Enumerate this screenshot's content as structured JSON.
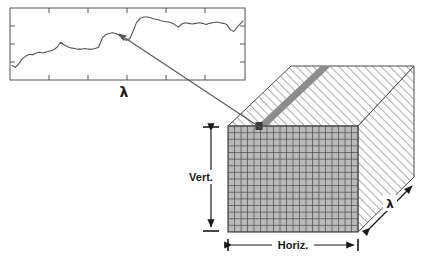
{
  "figure": {
    "background_color": "#ffffff",
    "width": 435,
    "height": 263
  },
  "spectrum_plot": {
    "frame_color": "#555555",
    "curve_color": "#555555",
    "axis_label": "λ",
    "tick_count_x": 5,
    "tick_count_y": 3,
    "box": {
      "x": 10,
      "y": 8,
      "width": 235,
      "height": 72
    }
  },
  "chart_data": {
    "type": "line",
    "title": "",
    "xlabel": "λ",
    "ylabel": "",
    "grid": false,
    "legend": null,
    "xlim": [
      0,
      100
    ],
    "ylim": [
      0,
      100
    ],
    "x": [
      0,
      1.5,
      3,
      4.5,
      6,
      7.5,
      9,
      10.5,
      12,
      13.5,
      15,
      16.5,
      18,
      19.5,
      21,
      22.5,
      24,
      25.5,
      27,
      28.5,
      30,
      31.5,
      33,
      34.5,
      36,
      37.5,
      39,
      40.5,
      42,
      43.5,
      45,
      46.5,
      48,
      49.5,
      51,
      52.5,
      54,
      55.5,
      57,
      58.5,
      60,
      61.5,
      63,
      64.5,
      66,
      67.5,
      69,
      70.5,
      72,
      73.5,
      75,
      76.5,
      78,
      79.5,
      81,
      82.5,
      84,
      85.5,
      87,
      88.5,
      90,
      91.5,
      93,
      94.5,
      96,
      97.5,
      100
    ],
    "values": [
      15,
      12,
      18,
      26,
      30,
      33,
      32,
      35,
      36,
      35,
      37,
      38,
      40,
      44,
      52,
      48,
      45,
      43,
      42,
      41,
      41,
      42,
      41,
      41,
      42,
      44,
      58,
      64,
      66,
      67,
      66,
      63,
      57,
      55,
      58,
      70,
      84,
      90,
      92,
      92,
      91,
      89,
      88,
      86,
      85,
      84,
      83,
      80,
      76,
      81,
      83,
      82,
      81,
      82,
      83,
      82,
      80,
      82,
      83,
      84,
      83,
      82,
      80,
      72,
      69,
      76,
      86
    ]
  },
  "pointer_arrow": {
    "from": {
      "x": 261,
      "y": 128
    },
    "to": {
      "x": 118,
      "y": 33
    },
    "color": "#555555",
    "name": "spectrum-pointer-arrow"
  },
  "cube": {
    "hatch_color": "#8a8a8a",
    "edge_color": "#4a4a4a",
    "face_fill": "#ffffff",
    "front_face": {
      "fill": "#b9b9b9",
      "grid_line_color": "#4a4a4a",
      "columns": 20,
      "rows": 16,
      "box": {
        "x": 228,
        "y": 126,
        "width": 130,
        "height": 106
      }
    },
    "selected_pixel": {
      "color": "#3a3a3a",
      "x": 259,
      "y": 124,
      "size": 7
    },
    "band_stripe": {
      "color": "#8c8c8c",
      "description": "spectral column running into the cube"
    }
  },
  "dimension_labels": {
    "vertical": "Vert.",
    "horizontal": "Horiz.",
    "depth": "λ"
  }
}
